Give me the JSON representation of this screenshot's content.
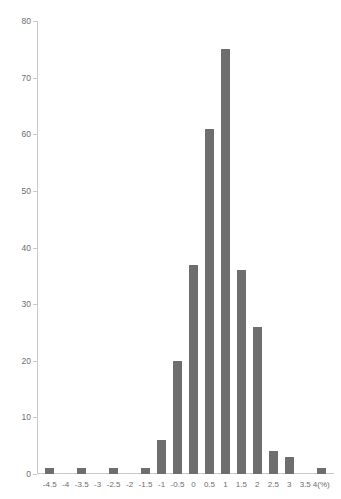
{
  "chart_data": {
    "type": "bar",
    "title": "",
    "xlabel": "(%)",
    "ylabel": "",
    "categories": [
      "-4.5",
      "-4",
      "-3.5",
      "-3",
      "-2.5",
      "-2",
      "-1.5",
      "-1",
      "-0.5",
      "0",
      "0.5",
      "1",
      "1.5",
      "2",
      "2.5",
      "3",
      "3.5",
      "4"
    ],
    "values": [
      1,
      0,
      1,
      0,
      1,
      0,
      1,
      6,
      20,
      37,
      61,
      75,
      36,
      26,
      4,
      3,
      0,
      1
    ],
    "xtick_labels": [
      "-4.5",
      "-4",
      "-3.5",
      "-3",
      "-2.5",
      "-2",
      "-1.5",
      "-1",
      "-0.5",
      "0",
      "0.5",
      "1",
      "1.5",
      "2",
      "2.5",
      "3",
      "3.5",
      "4(%)"
    ],
    "ytick_labels": [
      "0",
      "10",
      "20",
      "30",
      "40",
      "50",
      "60",
      "70",
      "80"
    ],
    "ytick_values": [
      0,
      10,
      20,
      30,
      40,
      50,
      60,
      70,
      80
    ],
    "ylim": [
      0,
      80
    ],
    "grid": false,
    "legend": false,
    "bar_color": "#6e6e6e",
    "axis_color": "#c9c9c9",
    "text_color": "#6d6d6d"
  }
}
